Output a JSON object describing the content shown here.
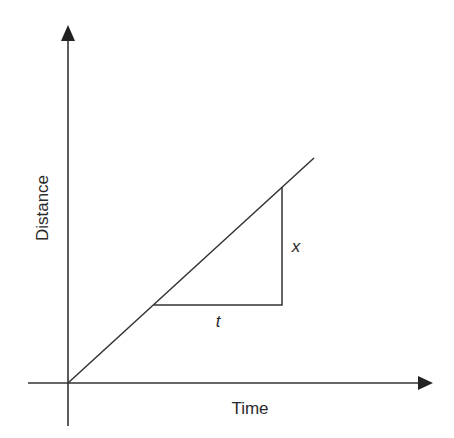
{
  "diagram": {
    "title": "",
    "x_axis_label": "Time",
    "y_axis_label": "Distance",
    "rise_label": "x",
    "run_label": "t",
    "line_color": "#333333"
  }
}
